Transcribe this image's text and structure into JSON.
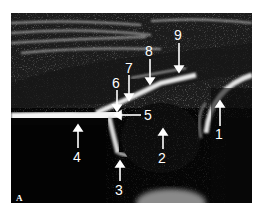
{
  "figure": {
    "panel_letter": "A",
    "image_type": "grayscale ultrasound",
    "background_color": "#ffffff",
    "image_color": "#050505",
    "annotation_color": "#ffffff",
    "labels": [
      {
        "id": "1",
        "text": "1",
        "arrow": "up"
      },
      {
        "id": "2",
        "text": "2",
        "arrow": "up"
      },
      {
        "id": "3",
        "text": "3",
        "arrow": "up"
      },
      {
        "id": "4",
        "text": "4",
        "arrow": "up"
      },
      {
        "id": "5",
        "text": "5",
        "arrow": "left"
      },
      {
        "id": "6",
        "text": "6",
        "arrow": "down"
      },
      {
        "id": "7",
        "text": "7",
        "arrow": "down"
      },
      {
        "id": "8",
        "text": "8",
        "arrow": "down"
      },
      {
        "id": "9",
        "text": "9",
        "arrow": "down"
      }
    ]
  }
}
